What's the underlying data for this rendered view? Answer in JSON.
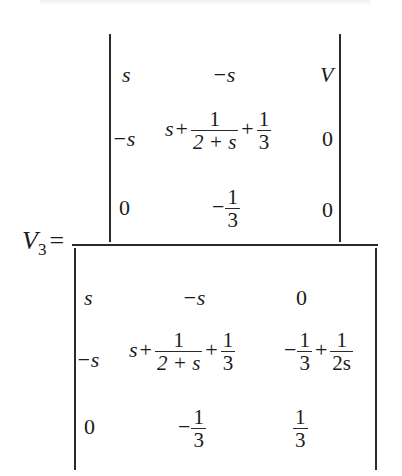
{
  "equation": {
    "lhs": {
      "var": "V",
      "sub": "3",
      "eq": "="
    },
    "numerator": {
      "rows": [
        {
          "c1": "s",
          "c2": "−s",
          "c3": "V"
        },
        {
          "c1": "−s",
          "c2": {
            "lead": "s",
            "plus1": "+",
            "f1_num": "1",
            "f1_den": "2 + s",
            "plus2": "+",
            "f2_num": "1",
            "f2_den": "3"
          },
          "c3": "0"
        },
        {
          "c1": "0",
          "c2": {
            "sign": "−",
            "num": "1",
            "den": "3"
          },
          "c3": "0"
        }
      ]
    },
    "denominator": {
      "rows": [
        {
          "c1": "s",
          "c2": "−s",
          "c3": "0"
        },
        {
          "c1": "−s",
          "c2": {
            "lead": "s",
            "plus1": "+",
            "f1_num": "1",
            "f1_den": "2 + s",
            "plus2": "+",
            "f2_num": "1",
            "f2_den": "3"
          },
          "c3": {
            "sign": "−",
            "f1_num": "1",
            "f1_den": "3",
            "plus": "+",
            "f2_num": "1",
            "f2_den": "2s"
          }
        },
        {
          "c1": "0",
          "c2": {
            "sign": "−",
            "num": "1",
            "den": "3"
          },
          "c3": {
            "num": "1",
            "den": "3"
          }
        }
      ]
    }
  },
  "colors": {
    "ink": "#1a1a1a",
    "background": "#ffffff"
  }
}
